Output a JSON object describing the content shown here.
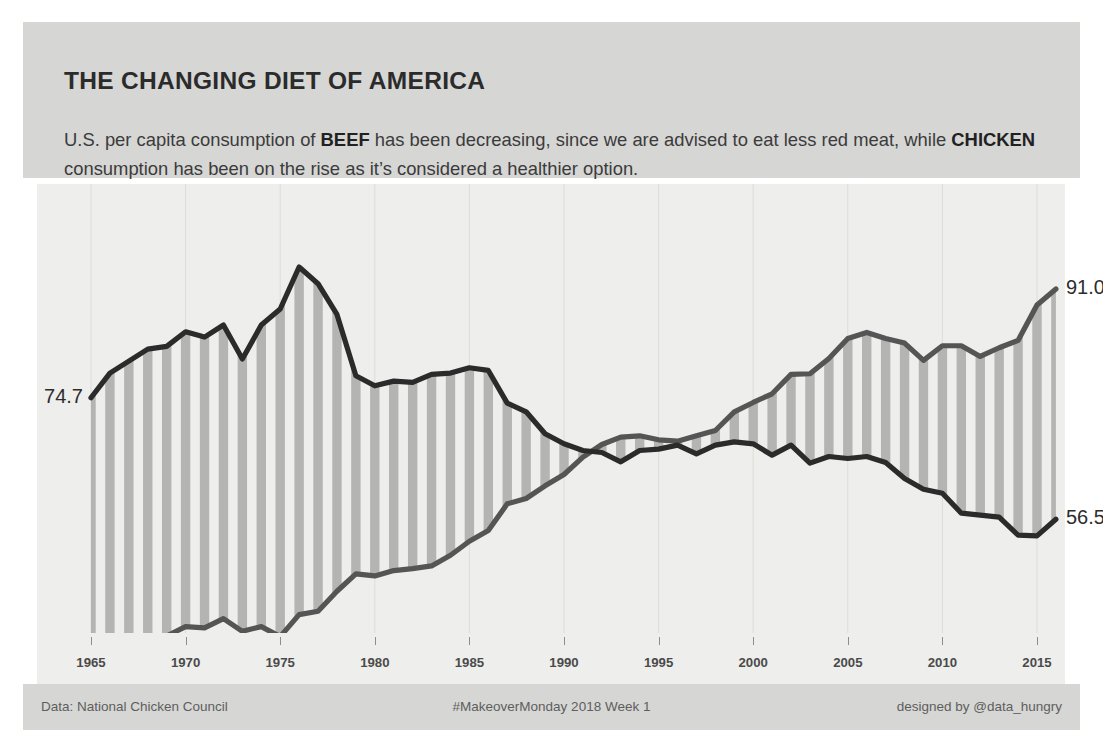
{
  "header": {
    "title": "THE CHANGING DIET OF AMERICA",
    "subtitle_part1": "U.S. per capita consumption of ",
    "subtitle_bold1": "BEEF",
    "subtitle_part2": " has been decreasing, since we are advised to eat less red meat, while ",
    "subtitle_bold2": "CHICKEN",
    "subtitle_part3": " consumption has been on the rise as it’s considered a healthier option."
  },
  "footer": {
    "source": "Data: National Chicken Council",
    "project": "#MakeoverMonday 2018 Week 1",
    "credit": "designed by @data_hungry"
  },
  "labels": {
    "beef_start": "74.7",
    "beef_end": "56.5",
    "chicken_start": "36.4",
    "chicken_end": "91.0"
  },
  "colors": {
    "band_background": "#d6d6d4",
    "plot_background": "#eeeeec",
    "beef_line": "#2b2b2b",
    "chicken_line": "#555555",
    "stripe_fill": "#b4b4b2",
    "gridline": "#dcdcda",
    "page_background": "#ffffff"
  },
  "chart_data": {
    "type": "line",
    "title": "THE CHANGING DIET OF AMERICA",
    "subtitle": "U.S. per capita consumption of BEEF has been decreasing, since we are advised to eat less red meat, while CHICKEN consumption has been on the rise as it’s considered a healthier option.",
    "xlabel": "",
    "ylabel": "",
    "xlim": [
      1965,
      2016
    ],
    "ylim": [
      0,
      100
    ],
    "grid": true,
    "legend_position": "none",
    "annotations": [
      {
        "text": "74.7",
        "series": "Beef",
        "x": 1965,
        "y": 74.7,
        "position": "left"
      },
      {
        "text": "36.4",
        "series": "Chicken",
        "x": 1965,
        "y": 36.4,
        "position": "left"
      },
      {
        "text": "56.5",
        "series": "Beef",
        "x": 2016,
        "y": 56.5,
        "position": "right"
      },
      {
        "text": "91.0",
        "series": "Chicken",
        "x": 2016,
        "y": 91.0,
        "position": "right"
      }
    ],
    "xticks": [
      1965,
      1970,
      1975,
      1980,
      1985,
      1990,
      1995,
      2000,
      2005,
      2010,
      2015
    ],
    "x": [
      1965,
      1966,
      1967,
      1968,
      1969,
      1970,
      1971,
      1972,
      1973,
      1974,
      1975,
      1976,
      1977,
      1978,
      1979,
      1980,
      1981,
      1982,
      1983,
      1984,
      1985,
      1986,
      1987,
      1988,
      1989,
      1990,
      1991,
      1992,
      1993,
      1994,
      1995,
      1996,
      1997,
      1998,
      1999,
      2000,
      2001,
      2002,
      2003,
      2004,
      2005,
      2006,
      2007,
      2008,
      2009,
      2010,
      2011,
      2012,
      2013,
      2014,
      2015,
      2016
    ],
    "series": [
      {
        "name": "Beef",
        "color": "#2b2b2b",
        "values": [
          74.7,
          78.4,
          80.2,
          82.0,
          82.4,
          84.6,
          83.8,
          85.6,
          80.5,
          85.6,
          88.0,
          94.3,
          91.8,
          87.2,
          78.0,
          76.5,
          77.2,
          77.0,
          78.2,
          78.4,
          79.2,
          78.8,
          73.9,
          72.6,
          69.3,
          67.8,
          66.8,
          66.5,
          65.1,
          66.8,
          67.0,
          67.6,
          66.3,
          67.6,
          68.1,
          67.8,
          66.1,
          67.6,
          64.9,
          65.9,
          65.6,
          65.9,
          65.0,
          62.6,
          61.0,
          60.4,
          57.4,
          57.1,
          56.8,
          54.1,
          54.0,
          56.5
        ]
      },
      {
        "name": "Chicken",
        "color": "#555555",
        "values": [
          36.4,
          36.1,
          37.6,
          37.8,
          39.0,
          40.4,
          40.2,
          41.6,
          39.7,
          40.4,
          38.9,
          42.2,
          42.7,
          45.7,
          48.3,
          48.0,
          48.8,
          49.1,
          49.5,
          51.1,
          53.2,
          54.8,
          58.8,
          59.6,
          61.5,
          63.2,
          65.8,
          67.7,
          68.8,
          69.0,
          68.4,
          68.2,
          69.0,
          69.8,
          72.6,
          74.0,
          75.3,
          78.2,
          78.3,
          80.6,
          83.6,
          84.5,
          83.6,
          82.9,
          80.3,
          82.5,
          82.5,
          80.9,
          82.2,
          83.3,
          88.6,
          91.0
        ]
      }
    ]
  }
}
